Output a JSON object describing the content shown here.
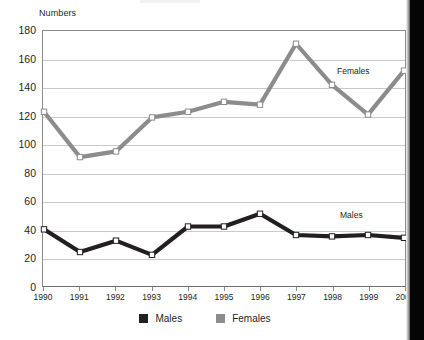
{
  "page": {
    "background_color": "#ffffff",
    "gutter_color": "#050505"
  },
  "axis": {
    "y_title": "Numbers",
    "y_ticks": [
      180,
      160,
      140,
      120,
      100,
      80,
      60,
      40,
      20,
      0
    ],
    "y_min": 0,
    "y_max": 180,
    "x_ticks": [
      "1990",
      "1991",
      "1992",
      "1993",
      "1994",
      "1995",
      "1996",
      "1997",
      "1998",
      "1999",
      "2000"
    ]
  },
  "inline_labels": {
    "females": "Females",
    "males": "Males"
  },
  "legend": {
    "items": [
      {
        "label": "Males",
        "color": "#231f20"
      },
      {
        "label": "Females",
        "color": "#8c8c8c"
      }
    ]
  },
  "chart_data": {
    "type": "line",
    "title": "",
    "xlabel": "",
    "ylabel": "Numbers",
    "categories": [
      "1990",
      "1991",
      "1992",
      "1993",
      "1994",
      "1995",
      "1996",
      "1997",
      "1998",
      "1999",
      "2000"
    ],
    "ylim": [
      0,
      180
    ],
    "y_tick_step": 20,
    "grid": true,
    "legend_position": "bottom",
    "marker": "square-open",
    "series": [
      {
        "name": "Males",
        "color": "#231f20",
        "values": [
          40,
          24,
          32,
          22,
          42,
          42,
          51,
          36,
          35,
          36,
          34
        ]
      },
      {
        "name": "Females",
        "color": "#8c8c8c",
        "values": [
          123,
          91,
          95,
          119,
          123,
          130,
          128,
          171,
          142,
          121,
          152
        ]
      }
    ]
  }
}
